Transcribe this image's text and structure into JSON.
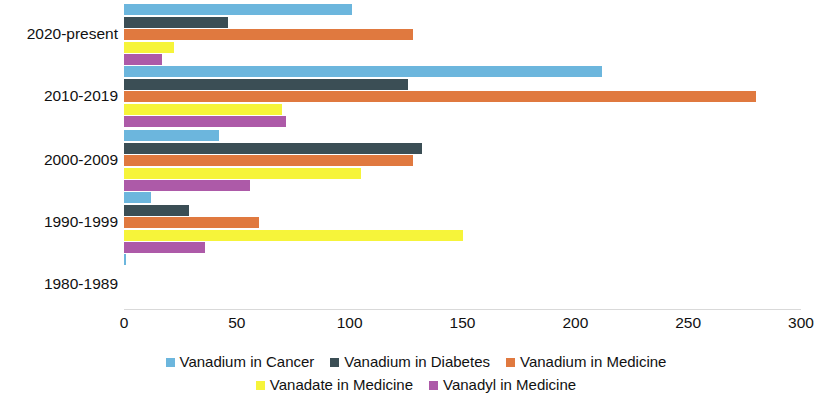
{
  "chart_data": {
    "type": "bar",
    "orientation": "horizontal",
    "title": "",
    "subtitle": "",
    "xlabel": "",
    "ylabel": "",
    "xlim": [
      0,
      300
    ],
    "xticks": [
      0,
      50,
      100,
      150,
      200,
      250,
      300
    ],
    "xtick_labels": [
      "0",
      "50",
      "100",
      "150",
      "200",
      "250",
      "300"
    ],
    "grid": false,
    "legend_position": "bottom",
    "categories": [
      "2020-present",
      "2010-2019",
      "2000-2009",
      "1990-1999",
      "1980-1989"
    ],
    "series": [
      {
        "name": "Vanadium in Cancer",
        "color": "#6CB6DD",
        "values": [
          101,
          212,
          42,
          12,
          1
        ]
      },
      {
        "name": "Vanadium in Diabetes",
        "color": "#3B4E55",
        "values": [
          46,
          126,
          132,
          29,
          0
        ]
      },
      {
        "name": "Vanadium in Medicine",
        "color": "#E0793F",
        "values": [
          128,
          280,
          128,
          60,
          0
        ]
      },
      {
        "name": "Vanadate in Medicine",
        "color": "#F6F43A",
        "values": [
          22,
          70,
          105,
          150,
          0
        ]
      },
      {
        "name": "Vanadyl in Medicine",
        "color": "#AD5AA8",
        "values": [
          17,
          72,
          56,
          36,
          0
        ]
      }
    ]
  }
}
